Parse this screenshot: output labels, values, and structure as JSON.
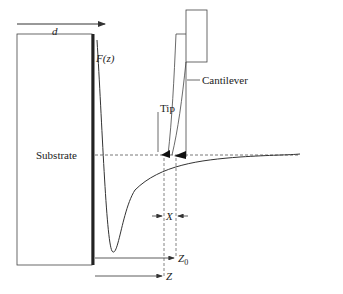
{
  "diagram": {
    "labels": {
      "d": "d",
      "force": "F(z)",
      "cantilever": "Cantilever",
      "tip": "Tip",
      "substrate": "Substrate",
      "x": "X",
      "z0": "Z",
      "z0_sub": "0",
      "z": "Z"
    },
    "colors": {
      "line": "#333333",
      "dashed": "#555555",
      "background": "#ffffff"
    }
  }
}
